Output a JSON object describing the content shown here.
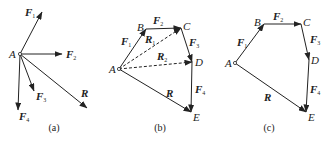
{
  "figure": {
    "panels": [
      {
        "id": "a",
        "caption": "(a)",
        "origin": {
          "label": "A",
          "x": 20,
          "y": 54,
          "lx": 9,
          "ly": 58
        },
        "vectors": [
          {
            "name": "F1",
            "base": "F",
            "sub": "1",
            "x2": 42,
            "y2": 12,
            "lx": 25,
            "ly": 16,
            "dashed": false
          },
          {
            "name": "F2",
            "base": "F",
            "sub": "2",
            "x2": 62,
            "y2": 54,
            "lx": 66,
            "ly": 58,
            "dashed": false
          },
          {
            "name": "F3",
            "base": "F",
            "sub": "3",
            "x2": 34,
            "y2": 91,
            "lx": 36,
            "ly": 100,
            "dashed": false
          },
          {
            "name": "F4",
            "base": "F",
            "sub": "4",
            "x2": 18,
            "y2": 110,
            "lx": 19,
            "ly": 120,
            "dashed": false
          },
          {
            "name": "R",
            "base": "R",
            "sub": "",
            "x2": 87,
            "y2": 108,
            "lx": 81,
            "ly": 97,
            "dashed": false
          }
        ]
      },
      {
        "id": "b",
        "caption": "(b)",
        "points": [
          {
            "label": "A",
            "x": 119,
            "y": 69,
            "lx": 109,
            "ly": 73
          },
          {
            "label": "B",
            "x": 146,
            "y": 29,
            "lx": 137,
            "ly": 31
          },
          {
            "label": "C",
            "x": 181,
            "y": 28,
            "lx": 183,
            "ly": 30
          },
          {
            "label": "D",
            "x": 192,
            "y": 62,
            "lx": 195,
            "ly": 66
          },
          {
            "label": "E",
            "x": 191,
            "y": 112,
            "lx": 193,
            "ly": 121
          }
        ],
        "vectors": [
          {
            "name": "F1",
            "base": "F",
            "sub": "1",
            "x1": 119,
            "y1": 69,
            "x2": 146,
            "y2": 29,
            "lx": 121,
            "ly": 45,
            "dashed": false
          },
          {
            "name": "F2",
            "base": "F",
            "sub": "2",
            "x1": 146,
            "y1": 29,
            "x2": 181,
            "y2": 28,
            "lx": 153,
            "ly": 24,
            "dashed": false
          },
          {
            "name": "F3",
            "base": "F",
            "sub": "3",
            "x1": 181,
            "y1": 28,
            "x2": 192,
            "y2": 62,
            "lx": 189,
            "ly": 46,
            "dashed": false
          },
          {
            "name": "F4",
            "base": "F",
            "sub": "4",
            "x1": 192,
            "y1": 62,
            "x2": 191,
            "y2": 112,
            "lx": 195,
            "ly": 93,
            "dashed": false
          },
          {
            "name": "R1",
            "base": "R",
            "sub": "1",
            "x1": 119,
            "y1": 69,
            "x2": 181,
            "y2": 28,
            "lx": 145,
            "ly": 43,
            "dashed": true
          },
          {
            "name": "R2",
            "base": "R",
            "sub": "2",
            "x1": 119,
            "y1": 69,
            "x2": 192,
            "y2": 62,
            "lx": 157,
            "ly": 60,
            "dashed": true
          },
          {
            "name": "R",
            "base": "R",
            "sub": "",
            "x1": 119,
            "y1": 69,
            "x2": 191,
            "y2": 112,
            "lx": 166,
            "ly": 97,
            "dashed": false
          }
        ]
      },
      {
        "id": "c",
        "caption": "(c)",
        "points": [
          {
            "label": "A",
            "x": 235,
            "y": 63,
            "lx": 225,
            "ly": 67
          },
          {
            "label": "B",
            "x": 264,
            "y": 24,
            "lx": 254,
            "ly": 26
          },
          {
            "label": "C",
            "x": 301,
            "y": 24,
            "lx": 303,
            "ly": 26
          },
          {
            "label": "D",
            "x": 309,
            "y": 60,
            "lx": 311,
            "ly": 64
          },
          {
            "label": "E",
            "x": 306,
            "y": 112,
            "lx": 308,
            "ly": 121
          }
        ],
        "vectors": [
          {
            "name": "F1",
            "base": "F",
            "sub": "1",
            "x1": 235,
            "y1": 63,
            "x2": 264,
            "y2": 24,
            "lx": 237,
            "ly": 46,
            "dashed": false
          },
          {
            "name": "F2",
            "base": "F",
            "sub": "2",
            "x1": 264,
            "y1": 24,
            "x2": 301,
            "y2": 24,
            "lx": 273,
            "ly": 20,
            "dashed": false
          },
          {
            "name": "F3",
            "base": "F",
            "sub": "3",
            "x1": 301,
            "y1": 24,
            "x2": 309,
            "y2": 60,
            "lx": 310,
            "ly": 43,
            "dashed": false
          },
          {
            "name": "F4",
            "base": "F",
            "sub": "4",
            "x1": 309,
            "y1": 60,
            "x2": 306,
            "y2": 112,
            "lx": 310,
            "ly": 93,
            "dashed": false
          },
          {
            "name": "R",
            "base": "R",
            "sub": "",
            "x1": 235,
            "y1": 63,
            "x2": 306,
            "y2": 112,
            "lx": 264,
            "ly": 101,
            "dashed": false
          }
        ]
      }
    ],
    "captions_y": 131,
    "caption_x": {
      "a": 54,
      "b": 160,
      "c": 269
    },
    "colors": {
      "stroke": "#222222",
      "background": "#ffffff"
    }
  }
}
